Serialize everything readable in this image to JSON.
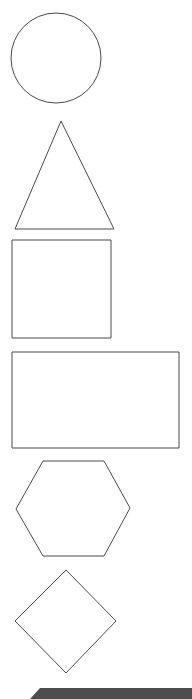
{
  "page": {
    "width": 192,
    "height": 699,
    "background_color": "#ffffff"
  },
  "style": {
    "outline_color": "#4a4a4a",
    "outline_width": 1,
    "fill_color": "none",
    "bar_color": "#4d4d4d"
  },
  "shapes": [
    {
      "id": "circle",
      "name": "circle",
      "label": "Circle",
      "geometry": {
        "cx": 56,
        "cy": 58,
        "r": 45
      },
      "bounds": {
        "x": 11,
        "y": 13,
        "width": 90,
        "height": 90
      }
    },
    {
      "id": "triangle",
      "name": "triangle",
      "label": "Triangle",
      "points": "61,121 114,229 15,229",
      "bounds": {
        "x": 15,
        "y": 121,
        "width": 99,
        "height": 108
      }
    },
    {
      "id": "square",
      "name": "square",
      "label": "Square",
      "geometry": {
        "x": 12,
        "y": 240,
        "width": 99,
        "height": 98
      },
      "bounds": {
        "x": 12,
        "y": 240,
        "width": 99,
        "height": 98
      }
    },
    {
      "id": "rectangle",
      "name": "rectangle",
      "label": "Rectangle",
      "geometry": {
        "x": 12,
        "y": 352,
        "width": 167,
        "height": 96
      },
      "bounds": {
        "x": 12,
        "y": 352,
        "width": 167,
        "height": 96
      }
    },
    {
      "id": "hexagon",
      "name": "hexagon",
      "label": "Hexagon",
      "points": "43,461 104,461 130,508 104,556 43,556 16,509",
      "bounds": {
        "x": 16,
        "y": 461,
        "width": 114,
        "height": 96
      }
    },
    {
      "id": "diamond",
      "name": "diamond",
      "label": "Diamond",
      "points": "66,570 116,621 66,673 15,621",
      "bounds": {
        "x": 15,
        "y": 570,
        "width": 101,
        "height": 103
      }
    }
  ],
  "bottom_bar": {
    "name": "bottom-bar",
    "label": "Bottom bar",
    "points": "30,699 40,688 192,688 192,699",
    "color": "#4d4d4d",
    "bounds": {
      "x": 30,
      "y": 688,
      "width": 162,
      "height": 11
    }
  }
}
